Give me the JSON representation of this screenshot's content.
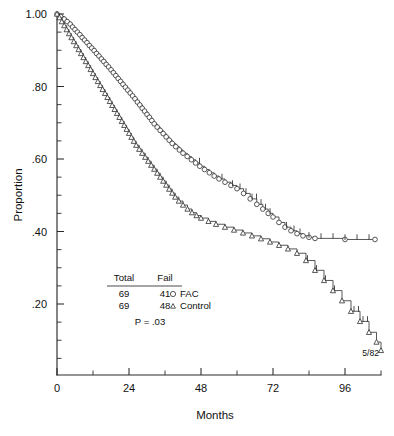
{
  "chart_data": {
    "type": "line",
    "title": "",
    "xlabel": "Months",
    "ylabel": "Proportion",
    "xlim": [
      0,
      108
    ],
    "ylim": [
      0,
      1.0
    ],
    "grid": false,
    "legend_position": "inside-lower-left",
    "x_ticks": [
      0,
      24,
      48,
      72,
      96
    ],
    "x_ticklabels": [
      "0",
      "24",
      "48",
      "72",
      "96"
    ],
    "x_minor_interval": 12,
    "y_ticks": [
      0.2,
      0.4,
      0.6,
      0.8,
      1.0
    ],
    "y_ticklabels": [
      ".20",
      ".40",
      ".60",
      ".80",
      "1.00"
    ],
    "y_minor_interval": 0.05,
    "annotation": "5/82",
    "series": [
      {
        "name": "FAC",
        "marker": "circle",
        "total": 69,
        "fail": 41,
        "points": [
          [
            0,
            1.0
          ],
          [
            1.2,
            0.993
          ],
          [
            2.4,
            0.986
          ],
          [
            3.4,
            0.979
          ],
          [
            4.4,
            0.972
          ],
          [
            5.2,
            0.964
          ],
          [
            6.0,
            0.957
          ],
          [
            6.8,
            0.95
          ],
          [
            7.6,
            0.943
          ],
          [
            8.4,
            0.935
          ],
          [
            9.2,
            0.928
          ],
          [
            10.0,
            0.921
          ],
          [
            10.8,
            0.913
          ],
          [
            11.6,
            0.906
          ],
          [
            12.4,
            0.899
          ],
          [
            13.2,
            0.891
          ],
          [
            14.0,
            0.884
          ],
          [
            14.8,
            0.876
          ],
          [
            15.6,
            0.869
          ],
          [
            16.4,
            0.861
          ],
          [
            17.2,
            0.854
          ],
          [
            18.0,
            0.846
          ],
          [
            18.8,
            0.838
          ],
          [
            19.6,
            0.83
          ],
          [
            20.4,
            0.822
          ],
          [
            21.2,
            0.814
          ],
          [
            22.0,
            0.806
          ],
          [
            22.8,
            0.798
          ],
          [
            23.6,
            0.79
          ],
          [
            24.4,
            0.782
          ],
          [
            25.2,
            0.774
          ],
          [
            26.0,
            0.766
          ],
          [
            26.8,
            0.757
          ],
          [
            27.6,
            0.749
          ],
          [
            28.4,
            0.74
          ],
          [
            29.2,
            0.732
          ],
          [
            30.0,
            0.723
          ],
          [
            30.8,
            0.715
          ],
          [
            31.6,
            0.706
          ],
          [
            32.4,
            0.697
          ],
          [
            33.4,
            0.688
          ],
          [
            34.4,
            0.679
          ],
          [
            35.4,
            0.67
          ],
          [
            36.4,
            0.661
          ],
          [
            37.4,
            0.652
          ],
          [
            38.4,
            0.643
          ],
          [
            39.6,
            0.634
          ],
          [
            40.8,
            0.625
          ],
          [
            42.0,
            0.616
          ],
          [
            43.4,
            0.607
          ],
          [
            44.8,
            0.598
          ],
          [
            46.2,
            0.589
          ],
          [
            47.6,
            0.58
          ],
          [
            49.2,
            0.571
          ],
          [
            50.8,
            0.562
          ],
          [
            52.4,
            0.553
          ],
          [
            54.0,
            0.545
          ],
          [
            56.0,
            0.536
          ],
          [
            58.0,
            0.527
          ],
          [
            60.0,
            0.518
          ],
          [
            62.2,
            0.505
          ],
          [
            64.4,
            0.49
          ],
          [
            66.6,
            0.475
          ],
          [
            68.6,
            0.462
          ],
          [
            70.4,
            0.45
          ],
          [
            72.0,
            0.44
          ],
          [
            74.0,
            0.425
          ],
          [
            76.0,
            0.412
          ],
          [
            78.0,
            0.402
          ],
          [
            80.0,
            0.394
          ],
          [
            82.0,
            0.388
          ],
          [
            84.0,
            0.384
          ],
          [
            86.0,
            0.381
          ],
          [
            96.0,
            0.378
          ],
          [
            106.0,
            0.378
          ]
        ],
        "censor_x": [
          47.5,
          55.0,
          58.5,
          61.0,
          63.0,
          65.0,
          66.5,
          68.0,
          69.5,
          71.0,
          76.5,
          79.0,
          81.0,
          84.0,
          88.0,
          92.0,
          96.0,
          100.0,
          104.0
        ]
      },
      {
        "name": "Control",
        "marker": "triangle",
        "total": 69,
        "fail": 48,
        "points": [
          [
            0,
            1.0
          ],
          [
            0.8,
            0.99
          ],
          [
            1.6,
            0.979
          ],
          [
            2.4,
            0.968
          ],
          [
            3.2,
            0.957
          ],
          [
            4.0,
            0.946
          ],
          [
            4.8,
            0.935
          ],
          [
            5.6,
            0.924
          ],
          [
            6.4,
            0.913
          ],
          [
            7.2,
            0.902
          ],
          [
            8.0,
            0.891
          ],
          [
            8.8,
            0.88
          ],
          [
            9.6,
            0.869
          ],
          [
            10.4,
            0.858
          ],
          [
            11.2,
            0.847
          ],
          [
            12.0,
            0.836
          ],
          [
            12.8,
            0.825
          ],
          [
            13.6,
            0.814
          ],
          [
            14.4,
            0.803
          ],
          [
            15.2,
            0.792
          ],
          [
            16.0,
            0.781
          ],
          [
            16.8,
            0.77
          ],
          [
            17.6,
            0.759
          ],
          [
            18.4,
            0.748
          ],
          [
            19.2,
            0.737
          ],
          [
            20.0,
            0.726
          ],
          [
            20.8,
            0.715
          ],
          [
            21.6,
            0.704
          ],
          [
            22.4,
            0.693
          ],
          [
            23.2,
            0.682
          ],
          [
            24.0,
            0.671
          ],
          [
            24.8,
            0.66
          ],
          [
            25.6,
            0.649
          ],
          [
            26.4,
            0.638
          ],
          [
            27.4,
            0.627
          ],
          [
            28.4,
            0.616
          ],
          [
            29.4,
            0.605
          ],
          [
            30.4,
            0.594
          ],
          [
            31.4,
            0.583
          ],
          [
            32.4,
            0.572
          ],
          [
            33.4,
            0.561
          ],
          [
            34.4,
            0.55
          ],
          [
            35.4,
            0.539
          ],
          [
            36.4,
            0.528
          ],
          [
            37.4,
            0.517
          ],
          [
            38.4,
            0.506
          ],
          [
            39.4,
            0.495
          ],
          [
            40.6,
            0.484
          ],
          [
            42.0,
            0.473
          ],
          [
            43.5,
            0.462
          ],
          [
            45.0,
            0.452
          ],
          [
            46.5,
            0.444
          ],
          [
            48.0,
            0.437
          ],
          [
            50.5,
            0.428
          ],
          [
            53.0,
            0.42
          ],
          [
            56.0,
            0.412
          ],
          [
            59.0,
            0.404
          ],
          [
            62.0,
            0.396
          ],
          [
            65.0,
            0.388
          ],
          [
            68.0,
            0.38
          ],
          [
            71.0,
            0.371
          ],
          [
            74.0,
            0.362
          ],
          [
            77.0,
            0.352
          ],
          [
            80.0,
            0.34
          ],
          [
            83.0,
            0.32
          ],
          [
            86.0,
            0.293
          ],
          [
            89.0,
            0.265
          ],
          [
            92.0,
            0.237
          ],
          [
            95.0,
            0.209
          ],
          [
            98.0,
            0.18
          ],
          [
            101.0,
            0.152
          ],
          [
            104.0,
            0.122
          ],
          [
            106.5,
            0.095
          ],
          [
            108.0,
            0.072
          ]
        ],
        "censor_x": [
          83.5,
          86.5,
          89.5,
          92.5,
          99.0,
          100.5,
          102.0,
          103.5
        ]
      }
    ]
  },
  "stats_table": {
    "headers": [
      "Total",
      "Fail"
    ],
    "rows": [
      {
        "total": "69",
        "fail": "41"
      },
      {
        "total": "69",
        "fail": "48"
      }
    ],
    "pvalue": "P  =  .03"
  },
  "legend": {
    "items": [
      {
        "label": "FAC",
        "marker": "circle"
      },
      {
        "label": "Control",
        "marker": "triangle"
      }
    ]
  }
}
